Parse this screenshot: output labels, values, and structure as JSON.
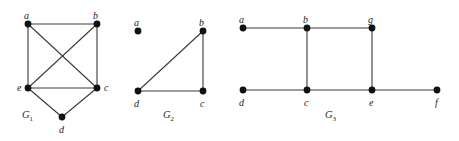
{
  "figure": {
    "width": 459,
    "height": 141,
    "background_color": "#ffffff",
    "edge_color": "#3a3a3a",
    "vertex_color": "#111111",
    "label_color": "#1a1a1a",
    "vertex_radius": 3.4,
    "edge_width": 1.1
  },
  "graphs": [
    {
      "id": "G1",
      "name": "G1",
      "label_text": "G",
      "label_sub": "1",
      "label_pos": {
        "x": 22,
        "y": 110
      },
      "vertices": [
        {
          "id": "a",
          "label": "a",
          "x": 28,
          "y": 24,
          "label_x": 24,
          "label_y": 11
        },
        {
          "id": "b",
          "label": "b",
          "x": 97,
          "y": 24,
          "label_x": 93,
          "label_y": 11
        },
        {
          "id": "e",
          "label": "e",
          "x": 28,
          "y": 88,
          "label_x": 17,
          "label_y": 83
        },
        {
          "id": "c",
          "label": "c",
          "x": 97,
          "y": 88,
          "label_x": 104,
          "label_y": 83
        },
        {
          "id": "d",
          "label": "d",
          "x": 62,
          "y": 117,
          "label_x": 59,
          "label_y": 125
        }
      ],
      "edges": [
        {
          "from": "a",
          "to": "b"
        },
        {
          "from": "a",
          "to": "e"
        },
        {
          "from": "a",
          "to": "c"
        },
        {
          "from": "b",
          "to": "e"
        },
        {
          "from": "b",
          "to": "c"
        },
        {
          "from": "e",
          "to": "c"
        },
        {
          "from": "e",
          "to": "d"
        },
        {
          "from": "d",
          "to": "c"
        }
      ]
    },
    {
      "id": "G2",
      "name": "G2",
      "label_text": "G",
      "label_sub": "2",
      "label_pos": {
        "x": 163,
        "y": 110
      },
      "vertices": [
        {
          "id": "a",
          "label": "a",
          "x": 138,
          "y": 31,
          "label_x": 134,
          "label_y": 18
        },
        {
          "id": "b",
          "label": "b",
          "x": 203,
          "y": 31,
          "label_x": 199,
          "label_y": 18
        },
        {
          "id": "d",
          "label": "d",
          "x": 138,
          "y": 91,
          "label_x": 134,
          "label_y": 99
        },
        {
          "id": "c",
          "label": "c",
          "x": 203,
          "y": 91,
          "label_x": 200,
          "label_y": 99
        }
      ],
      "edges": [
        {
          "from": "a",
          "to": "b",
          "style": "faded"
        },
        {
          "from": "b",
          "to": "c"
        },
        {
          "from": "b",
          "to": "d"
        },
        {
          "from": "d",
          "to": "c"
        }
      ]
    },
    {
      "id": "G3",
      "name": "G3",
      "label_text": "G",
      "label_sub": "3",
      "label_pos": {
        "x": 325,
        "y": 110
      },
      "vertices": [
        {
          "id": "a",
          "label": "a",
          "x": 243,
          "y": 28,
          "label_x": 239,
          "label_y": 15
        },
        {
          "id": "b",
          "label": "b",
          "x": 307,
          "y": 28,
          "label_x": 303,
          "label_y": 15
        },
        {
          "id": "g",
          "label": "g",
          "x": 372,
          "y": 28,
          "label_x": 368,
          "label_y": 15
        },
        {
          "id": "d",
          "label": "d",
          "x": 243,
          "y": 90,
          "label_x": 239,
          "label_y": 98
        },
        {
          "id": "c",
          "label": "c",
          "x": 307,
          "y": 90,
          "label_x": 304,
          "label_y": 98
        },
        {
          "id": "e",
          "label": "e",
          "x": 372,
          "y": 90,
          "label_x": 369,
          "label_y": 98
        },
        {
          "id": "f",
          "label": "f",
          "x": 437,
          "y": 90,
          "label_x": 435,
          "label_y": 98
        }
      ],
      "edges": [
        {
          "from": "a",
          "to": "b"
        },
        {
          "from": "b",
          "to": "g"
        },
        {
          "from": "b",
          "to": "c"
        },
        {
          "from": "g",
          "to": "e"
        },
        {
          "from": "d",
          "to": "c"
        },
        {
          "from": "c",
          "to": "e"
        },
        {
          "from": "e",
          "to": "f"
        }
      ]
    }
  ]
}
